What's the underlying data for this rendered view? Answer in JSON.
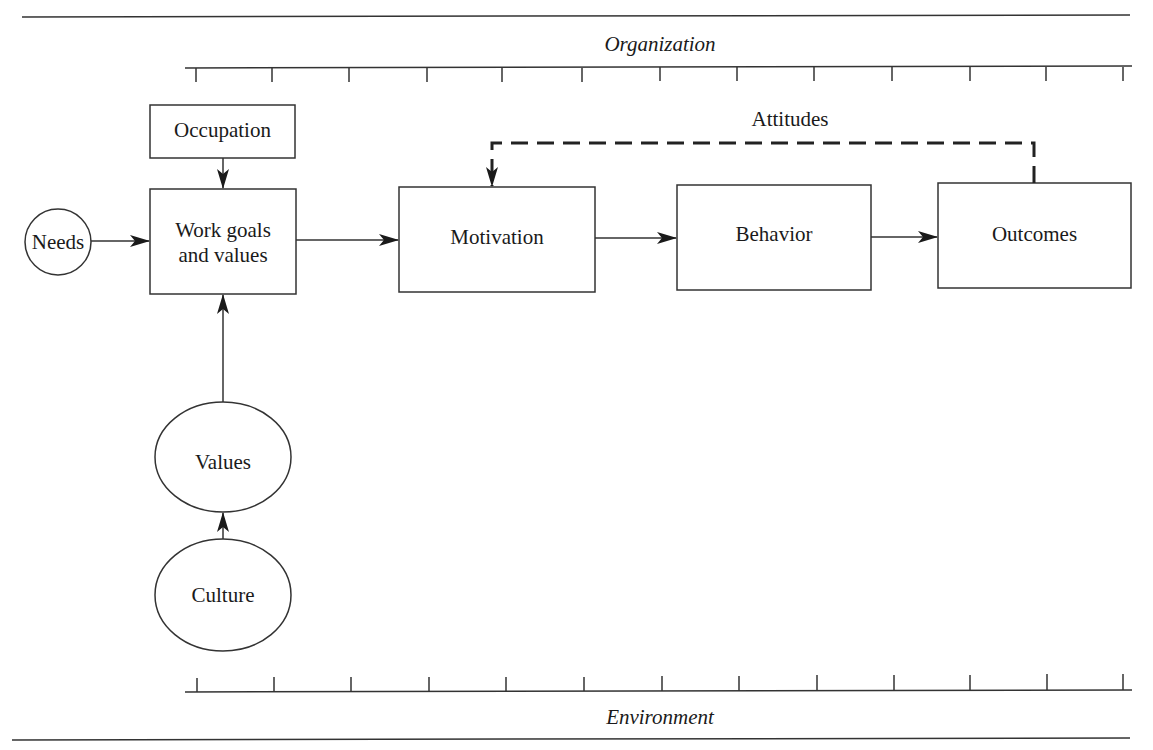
{
  "diagram": {
    "type": "flow",
    "bands": {
      "top_label": "Organization",
      "bottom_label": "Environment"
    },
    "nodes": [
      {
        "id": "occupation",
        "label": "Occupation",
        "shape": "rect"
      },
      {
        "id": "needs",
        "label": "Needs",
        "shape": "circle"
      },
      {
        "id": "work_goals",
        "label_line1": "Work goals",
        "label_line2": "and values",
        "shape": "rect"
      },
      {
        "id": "motivation",
        "label": "Motivation",
        "shape": "rect"
      },
      {
        "id": "behavior",
        "label": "Behavior",
        "shape": "rect"
      },
      {
        "id": "outcomes",
        "label": "Outcomes",
        "shape": "rect"
      },
      {
        "id": "values",
        "label": "Values",
        "shape": "ellipse"
      },
      {
        "id": "culture",
        "label": "Culture",
        "shape": "ellipse"
      }
    ],
    "edges": [
      {
        "from": "occupation",
        "to": "work_goals",
        "style": "solid"
      },
      {
        "from": "needs",
        "to": "work_goals",
        "style": "solid"
      },
      {
        "from": "values",
        "to": "work_goals",
        "style": "solid"
      },
      {
        "from": "culture",
        "to": "values",
        "style": "solid"
      },
      {
        "from": "work_goals",
        "to": "motivation",
        "style": "solid"
      },
      {
        "from": "motivation",
        "to": "behavior",
        "style": "solid"
      },
      {
        "from": "behavior",
        "to": "outcomes",
        "style": "solid"
      },
      {
        "from": "outcomes",
        "to": "motivation",
        "style": "dashed",
        "label": "Attitudes"
      }
    ]
  }
}
